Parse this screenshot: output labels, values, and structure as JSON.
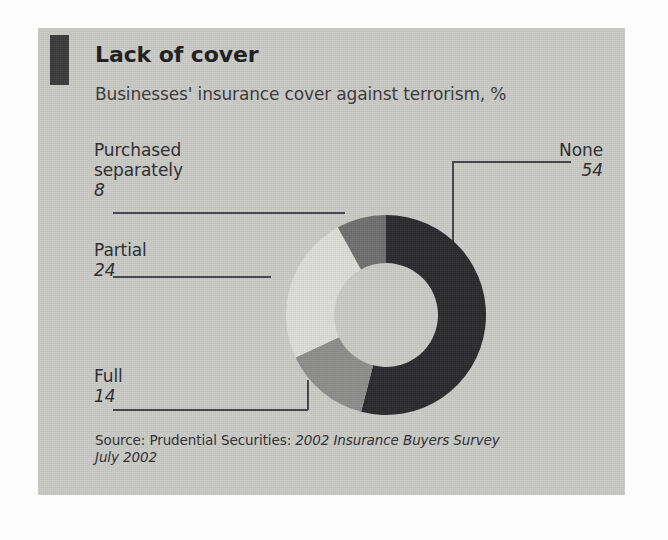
{
  "header": {
    "title": "Lack of cover",
    "subtitle": "Businesses' insurance cover against terrorism, %",
    "marker_color": "#3b3b3b"
  },
  "source": {
    "prefix": "Source: Prudential Securities: ",
    "italic_line1": "2002 Insurance Buyers Survey",
    "italic_line2": "July 2002"
  },
  "panel": {
    "background_color": "#c9c9c6"
  },
  "chart_data": {
    "type": "pie",
    "variant": "donut",
    "title": "Lack of cover",
    "subtitle": "Businesses' insurance cover against terrorism, %",
    "unit": "%",
    "total": 100,
    "start_angle_deg": 0,
    "direction": "clockwise",
    "inner_radius_ratio": 0.52,
    "legend": "callout-labels",
    "grid": false,
    "categories": [
      "None",
      "Full",
      "Partial",
      "Purchased separately"
    ],
    "values": [
      54,
      14,
      24,
      8
    ],
    "colors": [
      "#2b2b2d",
      "#8d8d8c",
      "#dbdbd8",
      "#6f6f70"
    ],
    "slices": [
      {
        "label": "None",
        "value": 54,
        "value_text": "54",
        "color": "#2b2b2d",
        "callout_position": "right"
      },
      {
        "label": "Full",
        "value": 14,
        "value_text": "14",
        "color": "#8d8d8c",
        "callout_position": "left-bottom"
      },
      {
        "label": "Partial",
        "value": 24,
        "value_text": "24",
        "color": "#dbdbd8",
        "callout_position": "left-middle"
      },
      {
        "label": "Purchased separately",
        "value": 8,
        "value_text": "8",
        "color": "#6f6f70",
        "callout_position": "left-top",
        "label_line1": "Purchased",
        "label_line2": "separately"
      }
    ]
  }
}
